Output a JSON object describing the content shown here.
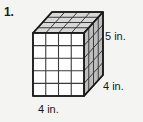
{
  "worksheet": {
    "problem_number": "1.",
    "background_color": "#f4f4f2"
  },
  "figure": {
    "name": "rectangular-prism",
    "faces": {
      "front": {
        "columns": 4,
        "rows": 5,
        "fill_color": "#ffffff"
      },
      "top": {
        "columns": 4,
        "rows": 4,
        "fill_color": "#d8d8d8"
      },
      "right": {
        "columns": 4,
        "rows": 5,
        "fill_color": "#bdbdbd"
      }
    },
    "edge_color": "#1a1a1a",
    "grid_color": "#3a3a3a"
  },
  "dimensions": {
    "width": {
      "value": 4,
      "unit": "in.",
      "label": "4 in."
    },
    "depth": {
      "value": 4,
      "unit": "in.",
      "label": "4 in."
    },
    "height": {
      "value": 5,
      "unit": "in.",
      "label": "5 in."
    }
  }
}
